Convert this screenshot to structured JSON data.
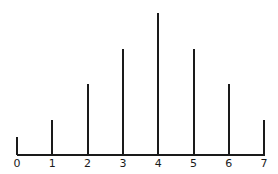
{
  "chart_data": {
    "type": "bar",
    "style": "stem",
    "title": "",
    "xlabel": "",
    "ylabel": "",
    "categories": [
      "0",
      "1",
      "2",
      "3",
      "4",
      "5",
      "6",
      "7"
    ],
    "values": [
      1,
      2,
      4,
      6,
      8,
      6,
      4,
      2
    ],
    "ylim": [
      0,
      8
    ],
    "grid": false,
    "legend": null,
    "y_axis_shown": false
  },
  "layout": {
    "baseline_y": 155,
    "x_start": 17,
    "x_step": 35.3,
    "px_per_unit": 17.7,
    "line_color": "#1a1a1a"
  }
}
